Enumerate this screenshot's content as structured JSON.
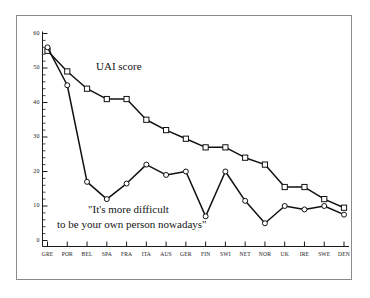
{
  "chart_data": {
    "type": "line",
    "title": "",
    "subtitle": "",
    "xlabel": "",
    "ylabel": "",
    "ylim": [
      0,
      60
    ],
    "yticks": [
      0,
      10,
      20,
      30,
      40,
      50,
      60
    ],
    "ytick_labels": [
      "0",
      "10",
      "20",
      "30",
      "40",
      "50",
      "60"
    ],
    "minor_tick_step": 2,
    "grid": false,
    "legend_position": "inline-annotation",
    "categories": [
      "GRE",
      "POR",
      "BEL",
      "SPA",
      "FRA",
      "ITA",
      "AUS",
      "GER",
      "FIN",
      "SWI",
      "NET",
      "NOR",
      "UK",
      "IRE",
      "SWE",
      "DEN"
    ],
    "series": [
      {
        "name": "UAI score",
        "marker": "square",
        "color": "#111111",
        "values": [
          55,
          49,
          44,
          41,
          41,
          35,
          32,
          29.5,
          27,
          27,
          24,
          22,
          15.5,
          15.5,
          12,
          9.5
        ]
      },
      {
        "name": "\"It's more difficult to be your own person nowadays\"",
        "marker": "circle",
        "color": "#111111",
        "values": [
          56,
          45,
          17,
          12,
          16.5,
          22,
          19,
          20,
          7,
          20,
          11.5,
          5,
          10,
          9,
          10,
          7.5
        ]
      }
    ],
    "annotations": [
      {
        "id": "uai-score",
        "text": "UAI score"
      },
      {
        "id": "quote-line-1",
        "text": "\"It's more difficult"
      },
      {
        "id": "quote-line-2",
        "text": "to be your own person nowadays\""
      }
    ]
  },
  "figure": {
    "frame_color": "#8a8a8a",
    "axis_color": "#1a1a1a",
    "background": "#ffffff"
  }
}
